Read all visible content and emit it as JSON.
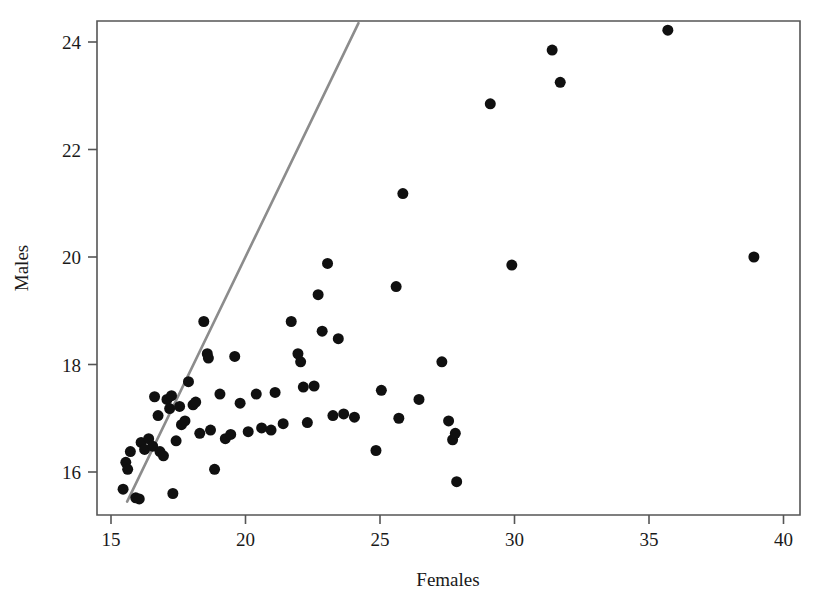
{
  "chart_data": {
    "type": "scatter",
    "title": "",
    "xlabel": "Females",
    "ylabel": "Males",
    "xlim": [
      15,
      40
    ],
    "ylim": [
      15.2,
      24.6
    ],
    "xticks": [
      15,
      20,
      25,
      30,
      35,
      40
    ],
    "yticks": [
      16,
      18,
      20,
      22,
      24
    ],
    "grid": false,
    "legend": null,
    "marker": {
      "shape": "circle",
      "color": "#101010",
      "size_px": 11
    },
    "series": [
      {
        "name": "observations",
        "points": [
          [
            15.45,
            15.68
          ],
          [
            15.55,
            16.18
          ],
          [
            15.62,
            16.05
          ],
          [
            15.72,
            16.38
          ],
          [
            15.92,
            15.52
          ],
          [
            16.05,
            15.5
          ],
          [
            16.12,
            16.55
          ],
          [
            16.25,
            16.42
          ],
          [
            16.4,
            16.62
          ],
          [
            16.55,
            16.48
          ],
          [
            16.62,
            17.4
          ],
          [
            16.75,
            17.05
          ],
          [
            16.82,
            16.38
          ],
          [
            16.95,
            16.3
          ],
          [
            17.08,
            17.35
          ],
          [
            17.18,
            17.18
          ],
          [
            17.25,
            17.42
          ],
          [
            17.3,
            15.6
          ],
          [
            17.42,
            16.58
          ],
          [
            17.55,
            17.22
          ],
          [
            17.62,
            16.88
          ],
          [
            17.75,
            16.95
          ],
          [
            17.88,
            17.68
          ],
          [
            18.05,
            17.25
          ],
          [
            18.15,
            17.3
          ],
          [
            18.3,
            16.72
          ],
          [
            18.45,
            18.8
          ],
          [
            18.58,
            18.2
          ],
          [
            18.62,
            18.12
          ],
          [
            18.7,
            16.78
          ],
          [
            18.85,
            16.05
          ],
          [
            19.05,
            17.45
          ],
          [
            19.25,
            16.62
          ],
          [
            19.45,
            16.7
          ],
          [
            19.6,
            18.15
          ],
          [
            19.8,
            17.28
          ],
          [
            20.1,
            16.75
          ],
          [
            20.4,
            17.45
          ],
          [
            20.6,
            16.82
          ],
          [
            20.95,
            16.78
          ],
          [
            21.1,
            17.48
          ],
          [
            21.4,
            16.9
          ],
          [
            21.7,
            18.8
          ],
          [
            21.95,
            18.2
          ],
          [
            22.05,
            18.05
          ],
          [
            22.15,
            17.58
          ],
          [
            22.3,
            16.92
          ],
          [
            22.55,
            17.6
          ],
          [
            22.7,
            19.3
          ],
          [
            22.85,
            18.62
          ],
          [
            23.05,
            19.88
          ],
          [
            23.25,
            17.05
          ],
          [
            23.45,
            18.48
          ],
          [
            23.65,
            17.08
          ],
          [
            24.05,
            17.02
          ],
          [
            24.85,
            16.4
          ],
          [
            25.05,
            17.52
          ],
          [
            25.6,
            19.45
          ],
          [
            25.7,
            17.0
          ],
          [
            25.85,
            21.18
          ],
          [
            26.45,
            17.35
          ],
          [
            27.3,
            18.05
          ],
          [
            27.55,
            16.95
          ],
          [
            27.7,
            16.6
          ],
          [
            27.8,
            16.72
          ],
          [
            27.85,
            15.82
          ],
          [
            29.1,
            22.85
          ],
          [
            29.9,
            19.85
          ],
          [
            31.4,
            23.85
          ],
          [
            31.7,
            23.25
          ],
          [
            35.7,
            24.22
          ],
          [
            38.9,
            20.0
          ]
        ]
      }
    ],
    "fit_line": {
      "name": "reference-line",
      "color": "#8c8c8c",
      "x_start": 15.6,
      "y_start": 15.45,
      "x_end": 24.2,
      "y_end": 24.35
    }
  }
}
